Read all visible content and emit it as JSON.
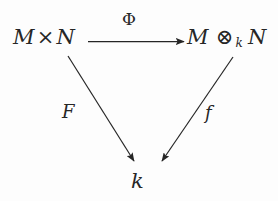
{
  "diagram": {
    "background_color": "#fdfdfd",
    "ink_color": "#262626",
    "nodes": {
      "source": {
        "id": "node-source",
        "latex": "M \\times N",
        "left": "M",
        "operator": "×",
        "right": "N"
      },
      "target": {
        "id": "node-target",
        "latex": "M \\otimes_k N",
        "left": "M",
        "operator": "⊗",
        "subscript": "k",
        "right": "N"
      },
      "base": {
        "id": "node-base",
        "latex": "k",
        "text": "k"
      }
    },
    "edges": [
      {
        "id": "edge-phi",
        "label": "Φ",
        "from": "source",
        "to": "target",
        "direction": "right",
        "kind": "horizontal-arrow"
      },
      {
        "id": "edge-F",
        "label": "F",
        "from": "source",
        "to": "base",
        "direction": "down-right",
        "kind": "diagonal-arrow"
      },
      {
        "id": "edge-f",
        "label": "f",
        "from": "target",
        "to": "base",
        "direction": "down-left",
        "kind": "diagonal-arrow"
      }
    ]
  }
}
